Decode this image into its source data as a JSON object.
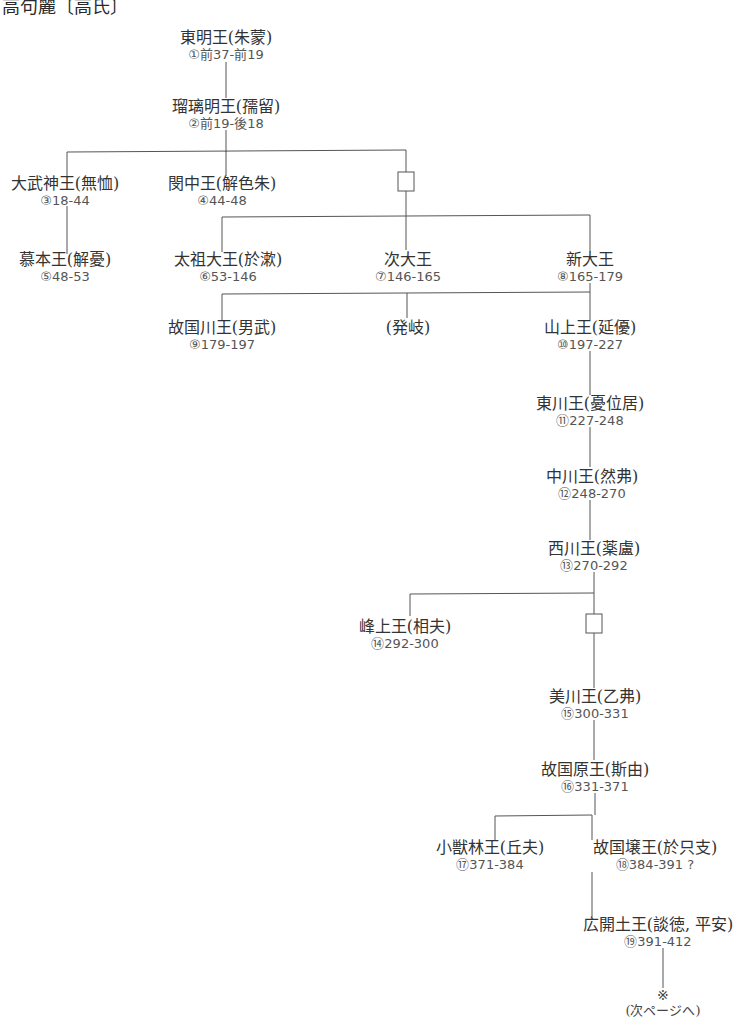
{
  "title": "高句麗〔高氏〕",
  "line_color": "#555555",
  "nodes": [
    {
      "id": "n1",
      "name": "東明王(朱蒙)",
      "reign": "①前37-前19"
    },
    {
      "id": "n2",
      "name": "瑠璃明王(孺留)",
      "reign": "②前19-後18"
    },
    {
      "id": "n3",
      "name": "大武神王(無恤)",
      "reign": "③18-44"
    },
    {
      "id": "n4",
      "name": "閔中王(解色朱)",
      "reign": "④44-48"
    },
    {
      "id": "n5",
      "name": "慕本王(解憂)",
      "reign": "⑤48-53"
    },
    {
      "id": "n6",
      "name": "太祖大王(於漱)",
      "reign": "⑥53-146"
    },
    {
      "id": "n7",
      "name": "次大王",
      "reign": "⑦146-165"
    },
    {
      "id": "n8",
      "name": "新大王",
      "reign": "⑧165-179"
    },
    {
      "id": "n9",
      "name": "故国川王(男武)",
      "reign": "⑨179-197"
    },
    {
      "id": "n_balgi",
      "name": "(発岐)",
      "reign": ""
    },
    {
      "id": "n10",
      "name": "山上王(延優)",
      "reign": "⑩197-227"
    },
    {
      "id": "n11",
      "name": "東川王(憂位居)",
      "reign": "⑪227-248"
    },
    {
      "id": "n12",
      "name": "中川王(然弗)",
      "reign": "⑫248-270"
    },
    {
      "id": "n13",
      "name": "西川王(薬盧)",
      "reign": "⑬270-292"
    },
    {
      "id": "n14",
      "name": "峰上王(相夫)",
      "reign": "⑭292-300"
    },
    {
      "id": "n15",
      "name": "美川王(乙弗)",
      "reign": "⑮300-331"
    },
    {
      "id": "n16",
      "name": "故国原王(斯由)",
      "reign": "⑯331-371"
    },
    {
      "id": "n17",
      "name": "小獣林王(丘夫)",
      "reign": "⑰371-384"
    },
    {
      "id": "n18",
      "name": "故国壌王(於只支)",
      "reign": "⑱384-391 ?"
    },
    {
      "id": "n19",
      "name": "広開土王(談徳, 平安)",
      "reign": "⑲391-412"
    }
  ],
  "unnamed_boxes": [
    {
      "id": "box1",
      "label": "□ unnamed ancestor (between 瑠璃明王 and 太祖大王/次大王/新大王)"
    },
    {
      "id": "box2",
      "label": "□ unnamed ancestor (between 西川王 and 美川王)"
    }
  ],
  "continuation": {
    "mark": "※",
    "label": "(次ページへ)"
  }
}
